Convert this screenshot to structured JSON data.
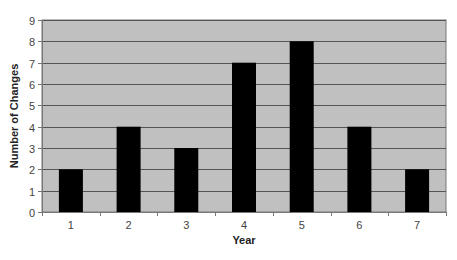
{
  "chart_data": {
    "type": "bar",
    "title": "",
    "xlabel": "Year",
    "ylabel": "Number of Changes",
    "categories": [
      "1",
      "2",
      "3",
      "4",
      "5",
      "6",
      "7"
    ],
    "values": [
      2,
      4,
      3,
      7,
      8,
      4,
      2
    ],
    "ylim": [
      0,
      9
    ],
    "yticks": [
      0,
      1,
      2,
      3,
      4,
      5,
      6,
      7,
      8,
      9
    ],
    "grid": true,
    "legend": null
  },
  "colors": {
    "plot_background": "#c0c0c0",
    "bar_fill": "#000000",
    "gridline": "#555555",
    "axis": "#777777",
    "tick_label": "#444444"
  }
}
